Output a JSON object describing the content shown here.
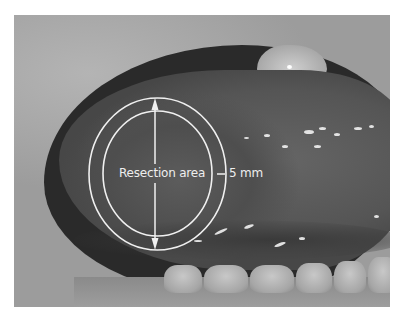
{
  "figure": {
    "type": "clinical-photograph",
    "labels": {
      "resection_area": "Resection area",
      "margin": "5 mm"
    },
    "colors": {
      "annotation": "#f0f0f0",
      "background": "#ffffff"
    },
    "overlay": {
      "outer_ellipse": {
        "cx": 157.5,
        "cy": 174,
        "rx": 68.5,
        "ry": 76
      },
      "inner_ellipse": {
        "cx": 157.5,
        "cy": 173.5,
        "rx": 54.5,
        "ry": 62.5
      },
      "vertical_arrow": {
        "x": 155,
        "y1": 98,
        "y2": 250
      },
      "margin_tick": {
        "x1": 217,
        "x2": 225,
        "y": 174
      }
    }
  }
}
